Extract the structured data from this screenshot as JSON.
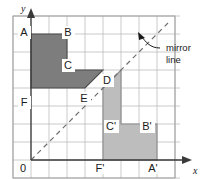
{
  "figure": {
    "background": "#ffffff",
    "grid": {
      "cols": 8,
      "rows": 8,
      "cell_px": 18,
      "origin_x_px": 31,
      "origin_y_px": 160,
      "line_color": "#bcbcbc",
      "border_color": "#9a9a9a"
    },
    "axes": {
      "x_label": "x",
      "y_label": "y",
      "origin_label": "0",
      "axis_color": "#3a3a3a"
    },
    "mirror": {
      "annotation_line1": "mirror",
      "annotation_line2": "line",
      "style": "dashed",
      "color": "#6e6e6e",
      "from": [
        0,
        0
      ],
      "to": [
        7.6,
        7.6
      ]
    },
    "shapes": [
      {
        "name": "object",
        "fill": "#7d7d7d",
        "stroke": "#4a4a4a",
        "vertices": [
          {
            "label": "A",
            "x": 0,
            "y": 7
          },
          {
            "label": "B",
            "x": 2,
            "y": 7
          },
          {
            "label": "C",
            "x": 2,
            "y": 5
          },
          {
            "label": "D",
            "x": 4,
            "y": 5
          },
          {
            "label": "E",
            "x": 3,
            "y": 4
          },
          {
            "label": "F",
            "x": 0,
            "y": 4
          }
        ]
      },
      {
        "name": "image",
        "fill": "#bdbdbd",
        "stroke": "#8a8a8a",
        "vertices": [
          {
            "label": "A'",
            "x": 7,
            "y": 0
          },
          {
            "label": "B'",
            "x": 7,
            "y": 2
          },
          {
            "label": "C'",
            "x": 5,
            "y": 2
          },
          {
            "label": "D'",
            "x": 5,
            "y": 5
          },
          {
            "label": "E'",
            "x": 4,
            "y": 4
          },
          {
            "label": "F'",
            "x": 4,
            "y": 0
          }
        ]
      }
    ],
    "point_labels": [
      {
        "text": "A",
        "x_px": 24,
        "y_px": 35,
        "anchor": "middle"
      },
      {
        "text": "B",
        "x_px": 68,
        "y_px": 35,
        "anchor": "middle"
      },
      {
        "text": "C",
        "x_px": 68,
        "y_px": 68,
        "anchor": "middle"
      },
      {
        "text": "D",
        "x_px": 107,
        "y_px": 83,
        "anchor": "middle"
      },
      {
        "text": "E",
        "x_px": 84,
        "y_px": 101,
        "anchor": "middle"
      },
      {
        "text": "F",
        "x_px": 24,
        "y_px": 105,
        "anchor": "middle"
      },
      {
        "text": "C'",
        "x_px": 110,
        "y_px": 129,
        "anchor": "middle"
      },
      {
        "text": "B'",
        "x_px": 146,
        "y_px": 129,
        "anchor": "middle"
      },
      {
        "text": "F'",
        "x_px": 99,
        "y_px": 169,
        "anchor": "middle"
      },
      {
        "text": "A'",
        "x_px": 152,
        "y_px": 169,
        "anchor": "middle"
      }
    ]
  }
}
